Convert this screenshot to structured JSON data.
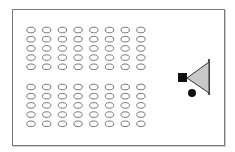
{
  "diagram": {
    "type": "room-layout",
    "frame": {
      "x": 12,
      "y": 9,
      "width": 211,
      "height": 135,
      "stroke": "#7a7a7a"
    },
    "seat_blocks": [
      {
        "name": "front-block",
        "rows": 5,
        "cols": 8,
        "origin_x": 31,
        "origin_y": 30,
        "col_pitch": 15.7,
        "row_pitch": 9.2
      },
      {
        "name": "back-block",
        "rows": 5,
        "cols": 8,
        "origin_x": 31,
        "origin_y": 87,
        "col_pitch": 15.7,
        "row_pitch": 9.2
      }
    ],
    "seat": {
      "rx": 4.2,
      "ry": 2.8,
      "stroke": "#777777",
      "fill": "#ffffff"
    },
    "screen_line": {
      "x": 209,
      "y1": 59,
      "y2": 95,
      "stroke": "#222222"
    },
    "projection_cone": {
      "apex": [
        187,
        78
      ],
      "top": [
        209,
        62
      ],
      "bottom": [
        209,
        93
      ],
      "fill": "#c8c8c8",
      "stroke": "#333333"
    },
    "projector": {
      "x": 178,
      "y": 73,
      "size": 9,
      "fill": "#111111"
    },
    "presenter": {
      "cx": 192,
      "cy": 93,
      "r": 4,
      "fill": "#111111"
    }
  }
}
